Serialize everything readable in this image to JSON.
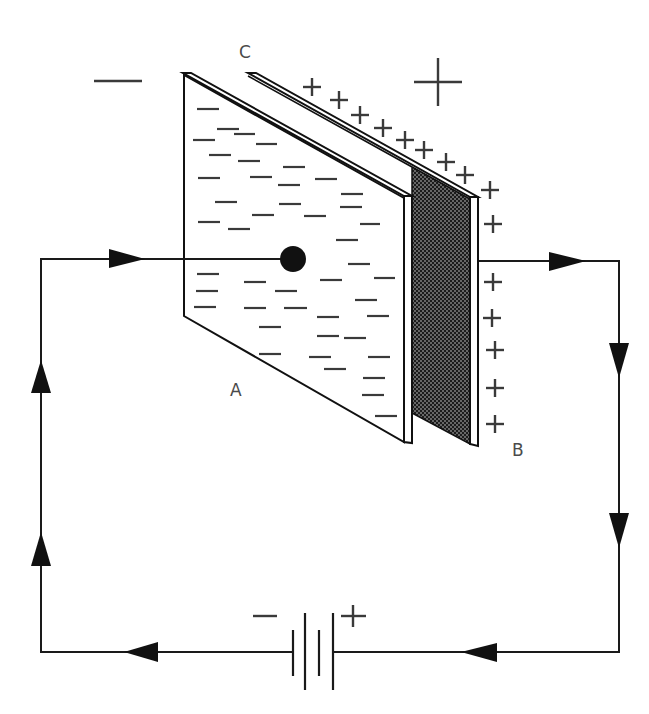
{
  "diagram": {
    "type": "circuit",
    "colors": {
      "line": "#1a1a1a",
      "charge_marks": "#3a3a3a",
      "label": "#4a4a4a",
      "plate_B_fill": "#1c1c1c",
      "background": "#ffffff"
    },
    "labels": {
      "plate_a": "A",
      "plate_b": "B",
      "gap_c": "C"
    },
    "charge_signs": {
      "negative_side": "−",
      "positive_side": "+"
    },
    "battery": {
      "negative_terminal": "−",
      "positive_terminal": "+",
      "cells": 2
    },
    "plates": [
      {
        "id": "A",
        "charge": "negative",
        "shading": "plain"
      },
      {
        "id": "B",
        "charge": "positive",
        "shading": "stippled"
      }
    ],
    "current_direction": "clockwise from battery − through plate A ... plate B back to battery +",
    "arrows": [
      {
        "wire": "top-left",
        "direction": "right"
      },
      {
        "wire": "top-right",
        "direction": "right"
      },
      {
        "wire": "right",
        "direction": "down"
      },
      {
        "wire": "right",
        "direction": "down"
      },
      {
        "wire": "bottom-right",
        "direction": "left"
      },
      {
        "wire": "bottom-left",
        "direction": "left"
      },
      {
        "wire": "left",
        "direction": "up"
      },
      {
        "wire": "left",
        "direction": "up"
      }
    ]
  }
}
